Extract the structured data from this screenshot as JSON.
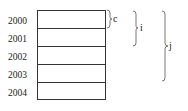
{
  "diagram": {
    "rows": [
      {
        "label": "2000"
      },
      {
        "label": "2001"
      },
      {
        "label": "2002"
      },
      {
        "label": "2003"
      },
      {
        "label": "2004"
      }
    ],
    "braces": [
      {
        "label": "c",
        "spans_rows": "2000"
      },
      {
        "label": "i",
        "spans_rows": "2000-2001"
      },
      {
        "label": "j",
        "spans_rows": "2000-2003"
      }
    ]
  }
}
